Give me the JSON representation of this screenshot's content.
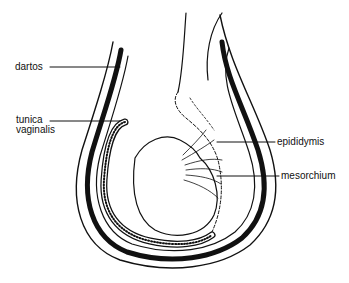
{
  "diagram": {
    "type": "anatomical line drawing",
    "labels": [
      {
        "id": "dartos",
        "text": "dartos"
      },
      {
        "id": "tunica_vaginalis_1",
        "text": "tunica"
      },
      {
        "id": "tunica_vaginalis_2",
        "text": "vaginalis"
      },
      {
        "id": "epididymis",
        "text": "epididymis"
      },
      {
        "id": "mesorchium",
        "text": "mesorchium"
      }
    ],
    "colors": {
      "ink": "#111111",
      "background": "#ffffff"
    }
  }
}
